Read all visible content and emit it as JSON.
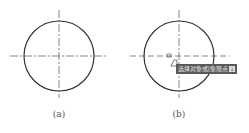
{
  "figures": [
    {
      "id": "a",
      "caption": "(a)",
      "circle": {
        "cx": 59,
        "cy": 56,
        "r": 35
      },
      "centerlines": {
        "h": [
          10,
          108
        ],
        "v": [
          10,
          98
        ]
      }
    },
    {
      "id": "b",
      "caption": "(b)",
      "circle": {
        "cx": 179,
        "cy": 56,
        "r": 35
      },
      "centerlines": {
        "h": [
          130,
          230
        ],
        "v": [
          10,
          98
        ]
      },
      "tooltip": {
        "text": "选择对象或[象限点]",
        "arrow": "↓"
      }
    }
  ],
  "colors": {
    "line": "#333333",
    "centerline": "#666666",
    "tooltip_bg": "#5a5a5a"
  }
}
